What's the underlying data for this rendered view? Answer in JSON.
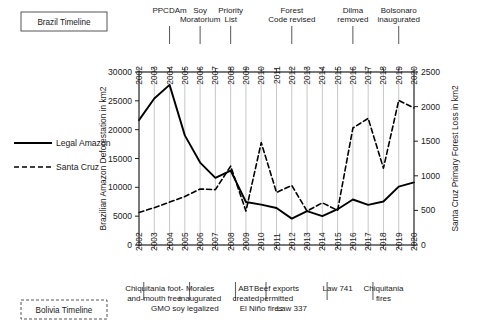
{
  "legend": {
    "series": [
      {
        "label": "Legal Amazon",
        "style": "solid"
      },
      {
        "label": "Santa Cruz",
        "style": "dashed"
      }
    ]
  },
  "timeline_boxes": [
    {
      "label": "Brazil Timeline",
      "border": "solid"
    },
    {
      "label": "Bolivia Timeline",
      "border": "dashed"
    }
  ],
  "brazil_events": [
    {
      "label": "PPCDAm",
      "year": 2004,
      "row": 0
    },
    {
      "label": "Soy Moratorium",
      "year": 2006,
      "row": 0
    },
    {
      "label": "Priority List",
      "year": 2008,
      "row": 0
    },
    {
      "label": "Forest Code revised",
      "year": 2012,
      "row": 0
    },
    {
      "label": "Dilma removed",
      "year": 2016,
      "row": 0
    },
    {
      "label": "Bolsonaro inaugurated",
      "year": 2019,
      "row": 0
    }
  ],
  "bolivia_events": [
    {
      "label": "Chiquitania foot-and-mouth free",
      "year": 2003,
      "row": 0
    },
    {
      "label": "Morales inaugurated",
      "year": 2006,
      "row": 0
    },
    {
      "label": "ABT created",
      "year": 2009,
      "row": 0
    },
    {
      "label": "Beef exports permitted",
      "year": 2011,
      "row": 0
    },
    {
      "label": "Law 741",
      "year": 2015,
      "row": 0
    },
    {
      "label": "Chiquitania fires",
      "year": 2018,
      "row": 0
    },
    {
      "label": "GMO soy legalized",
      "year": 2005,
      "row": 1
    },
    {
      "label": "El Niño fires",
      "year": 2010,
      "row": 1
    },
    {
      "label": "Law 337",
      "year": 2012,
      "row": 1
    }
  ],
  "chart_data": {
    "type": "line",
    "title": "",
    "xlabel": "",
    "ylabel": "Brazilian Amazon Deforestation in km2",
    "y2label": "Santa Cruz Primary Forest Loss in km2",
    "grid": true,
    "legend_position": "left-outside",
    "x": [
      2002,
      2003,
      2004,
      2005,
      2006,
      2007,
      2008,
      2009,
      2010,
      2011,
      2012,
      2013,
      2014,
      2015,
      2016,
      2017,
      2018,
      2019,
      2020
    ],
    "xtick_labels": [
      "2002",
      "2003",
      "2004",
      "2005",
      "2006",
      "2007",
      "2008",
      "2009",
      "2010",
      "2011",
      "2012",
      "2013",
      "2014",
      "2015",
      "2016",
      "2017",
      "2018",
      "2019",
      "2020"
    ],
    "ylim": [
      0,
      30000
    ],
    "yticks": [
      0,
      5000,
      10000,
      15000,
      20000,
      25000,
      30000
    ],
    "y2lim": [
      0,
      2500
    ],
    "y2ticks": [
      0,
      500,
      1000,
      1500,
      2000,
      2500
    ],
    "series": [
      {
        "name": "Legal Amazon",
        "axis": "left",
        "style": "solid",
        "color": "#000000",
        "values": [
          21650,
          25400,
          27770,
          19010,
          14290,
          11650,
          12910,
          7460,
          7000,
          6420,
          4570,
          5890,
          5010,
          6210,
          7890,
          6950,
          7540,
          10130,
          10850
        ]
      },
      {
        "name": "Santa Cruz",
        "axis": "right",
        "style": "dashed",
        "color": "#000000",
        "values": [
          470,
          540,
          620,
          700,
          810,
          800,
          1140,
          490,
          1480,
          760,
          860,
          490,
          610,
          500,
          1690,
          1830,
          1110,
          2090,
          1980
        ]
      }
    ]
  }
}
